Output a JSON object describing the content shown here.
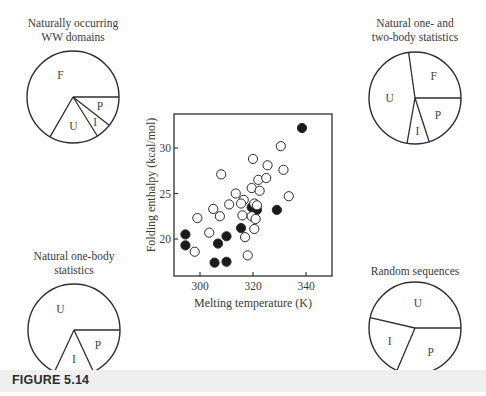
{
  "figure": {
    "caption": "FIGURE 5.14"
  },
  "pies": [
    {
      "id": "naturally-occurring",
      "title_lines": [
        "Naturally occurring",
        "WW domains"
      ],
      "cx": 73,
      "cy": 97,
      "r": 46,
      "slices": [
        {
          "label": "P",
          "start": 0,
          "end": 38
        },
        {
          "label": "I",
          "start": 38,
          "end": 58
        },
        {
          "label": "U",
          "start": 58,
          "end": 120
        },
        {
          "label": "F",
          "start": 120,
          "end": 360
        }
      ]
    },
    {
      "id": "one-two-body",
      "title_lines": [
        "Natural one- and",
        "two-body statistics"
      ],
      "cx": 415,
      "cy": 98,
      "r": 46,
      "slices": [
        {
          "label": "P",
          "start": 0,
          "end": 72
        },
        {
          "label": "I",
          "start": 72,
          "end": 100
        },
        {
          "label": "U",
          "start": 100,
          "end": 262
        },
        {
          "label": "F",
          "start": 262,
          "end": 360
        }
      ]
    },
    {
      "id": "one-body",
      "title_lines": [
        "Natural one-body",
        "statistics"
      ],
      "cx": 74,
      "cy": 330,
      "r": 46,
      "slices": [
        {
          "label": "P",
          "start": 0,
          "end": 65
        },
        {
          "label": "I",
          "start": 65,
          "end": 115
        },
        {
          "label": "U",
          "start": 115,
          "end": 360
        }
      ]
    },
    {
      "id": "random",
      "title_lines": [
        "Random sequences"
      ],
      "cx": 415,
      "cy": 328,
      "r": 46,
      "slices": [
        {
          "label": "P",
          "start": 0,
          "end": 113
        },
        {
          "label": "I",
          "start": 113,
          "end": 193
        },
        {
          "label": "U",
          "start": 193,
          "end": 360
        }
      ]
    }
  ],
  "chart_data": [
    {
      "type": "pie",
      "title": "Naturally occurring WW domains",
      "categories": [
        "F",
        "U",
        "I",
        "P"
      ],
      "values_degrees": [
        240,
        62,
        20,
        38
      ],
      "values_percent": [
        66.7,
        17.2,
        5.6,
        10.5
      ]
    },
    {
      "type": "pie",
      "title": "Natural one- and two-body statistics",
      "categories": [
        "F",
        "U",
        "I",
        "P"
      ],
      "values_degrees": [
        98,
        162,
        28,
        72
      ],
      "values_percent": [
        27.2,
        45.0,
        7.8,
        20.0
      ]
    },
    {
      "type": "pie",
      "title": "Natural one-body statistics",
      "categories": [
        "U",
        "I",
        "P"
      ],
      "values_degrees": [
        245,
        50,
        65
      ],
      "values_percent": [
        68.1,
        13.9,
        18.0
      ]
    },
    {
      "type": "pie",
      "title": "Random sequences",
      "categories": [
        "U",
        "I",
        "P"
      ],
      "values_degrees": [
        167,
        80,
        113
      ],
      "values_percent": [
        46.4,
        22.2,
        31.4
      ]
    },
    {
      "type": "scatter",
      "title": "",
      "xlabel": "Melting temperature (K)",
      "ylabel": "Folding enthalpy (kcal/mol)",
      "xlim": [
        290,
        350
      ],
      "ylim": [
        16.2,
        33.5
      ],
      "xticks": [
        300,
        320,
        340
      ],
      "yticks": [
        20,
        25,
        30
      ],
      "grid": false,
      "series": [
        {
          "name": "filled",
          "marker": "filled-circle",
          "points": [
            [
              338.5,
              32.2
            ],
            [
              294.5,
              20.5
            ],
            [
              294.5,
              19.3
            ],
            [
              305.5,
              17.4
            ],
            [
              310,
              17.5
            ],
            [
              306.8,
              19.5
            ],
            [
              310,
              20.3
            ],
            [
              315.5,
              21.2
            ],
            [
              319.5,
              23.5
            ],
            [
              321.5,
              23.2
            ],
            [
              329,
              23.2
            ]
          ]
        },
        {
          "name": "open",
          "marker": "open-circle",
          "points": [
            [
              330.5,
              30.2
            ],
            [
              320,
              28.8
            ],
            [
              325.5,
              28.1
            ],
            [
              331.5,
              27.6
            ],
            [
              308,
              27.1
            ],
            [
              322,
              26.5
            ],
            [
              325,
              26.7
            ],
            [
              319.5,
              25.6
            ],
            [
              322.5,
              25.3
            ],
            [
              333.5,
              24.7
            ],
            [
              313.5,
              25.0
            ],
            [
              316.5,
              24.3
            ],
            [
              315.5,
              23.9
            ],
            [
              320.5,
              23.9
            ],
            [
              321.5,
              23.7
            ],
            [
              311,
              23.8
            ],
            [
              305,
              23.3
            ],
            [
              307.5,
              22.5
            ],
            [
              299,
              22.3
            ],
            [
              316,
              22.6
            ],
            [
              319.5,
              22.5
            ],
            [
              321,
              22.2
            ],
            [
              320.5,
              21.1
            ],
            [
              303.5,
              20.7
            ],
            [
              317,
              20.2
            ],
            [
              298,
              18.6
            ],
            [
              318,
              18.2
            ]
          ]
        }
      ]
    }
  ],
  "scatter_axes": {
    "xlabel": "Melting temperature (K)",
    "ylabel": "Folding enthalpy (kcal/mol)",
    "xticks": [
      "300",
      "320",
      "340"
    ],
    "yticks": [
      "20",
      "25",
      "30"
    ]
  }
}
